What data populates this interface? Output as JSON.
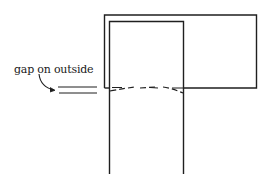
{
  "diagram": {
    "annotation": {
      "label": "gap on outside"
    },
    "colors": {
      "stroke": "#1f1f1f",
      "background": "#ffffff"
    },
    "elements": {
      "outer_rectangle": "large rectangle (top-right panel)",
      "inner_column": "vertical column inset within outer rectangle and extending down",
      "dashed_seam": "dashed irregular seam line across column at bottom edge of outer rectangle",
      "gap_marker": "two short parallel horizontal lines to the left of the column indicating gap",
      "arrow": "curved arrow from label pointing to gap marker"
    }
  }
}
